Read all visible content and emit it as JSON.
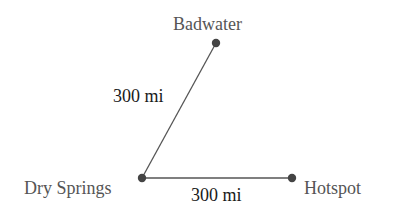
{
  "diagram": {
    "type": "network",
    "nodes": [
      {
        "id": "badwater",
        "label": "Badwater",
        "x": 216,
        "y": 43
      },
      {
        "id": "dry_springs",
        "label": "Dry Springs",
        "x": 142,
        "y": 178
      },
      {
        "id": "hotspot",
        "label": "Hotspot",
        "x": 292,
        "y": 178
      }
    ],
    "edges": [
      {
        "from": "dry_springs",
        "to": "badwater",
        "label": "300 mi"
      },
      {
        "from": "dry_springs",
        "to": "hotspot",
        "label": "300 mi"
      }
    ],
    "colors": {
      "line": "#555555",
      "node": "#444444",
      "node_label": "#555555",
      "edge_label": "#1a1a1a"
    }
  }
}
